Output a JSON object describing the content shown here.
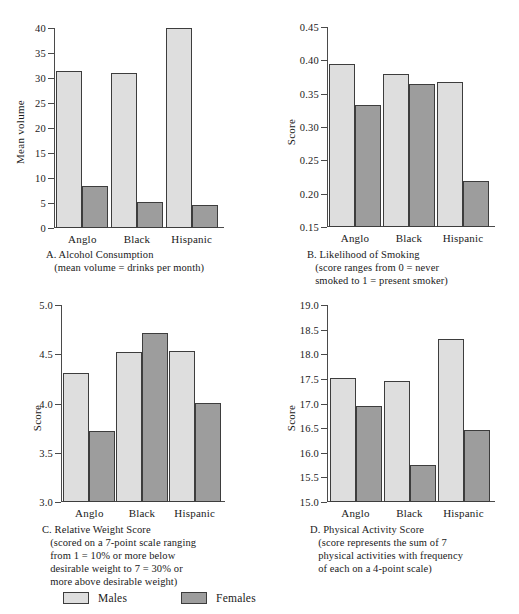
{
  "figure": {
    "categories": [
      "Anglo",
      "Black",
      "Hispanic"
    ],
    "legend": [
      {
        "key": "male",
        "label": "Males",
        "color": "#dedede"
      },
      {
        "key": "female",
        "label": "Females",
        "color": "#9d9d9d"
      }
    ]
  },
  "chart_data": [
    {
      "id": "A",
      "type": "bar",
      "title": "A. Alcohol Consumption",
      "subtitle": "(mean volume = drinks per month)",
      "caption_lines": [
        "A. Alcohol Consumption",
        "   (mean volume = drinks per month)"
      ],
      "xlabel": "",
      "ylabel": "Mean volume",
      "categories": [
        "Anglo",
        "Black",
        "Hispanic"
      ],
      "series": [
        {
          "name": "Males",
          "values": [
            31.5,
            31.0,
            40.3
          ]
        },
        {
          "name": "Females",
          "values": [
            8.5,
            5.2,
            4.6
          ]
        }
      ],
      "ylim": [
        0,
        40
      ],
      "yticks": [
        0,
        5,
        10,
        15,
        20,
        25,
        30,
        35,
        40
      ],
      "ytick_labels": [
        "0",
        "5",
        "10",
        "15",
        "20",
        "25",
        "30",
        "35",
        "40"
      ],
      "grid": false,
      "legend_position": "figure-bottom"
    },
    {
      "id": "B",
      "type": "bar",
      "title": "B. Likelihood of Smoking",
      "subtitle": "(score ranges from 0 = never smoked to 1 = present smoker)",
      "caption_lines": [
        "B. Likelihood of Smoking",
        "   (score ranges from 0 = never",
        "   smoked to 1 = present smoker)"
      ],
      "xlabel": "",
      "ylabel": "Score",
      "categories": [
        "Anglo",
        "Black",
        "Hispanic"
      ],
      "series": [
        {
          "name": "Males",
          "values": [
            0.395,
            0.379,
            0.367
          ]
        },
        {
          "name": "Females",
          "values": [
            0.333,
            0.365,
            0.219
          ]
        }
      ],
      "ylim": [
        0.15,
        0.45
      ],
      "yticks": [
        0.15,
        0.2,
        0.25,
        0.3,
        0.35,
        0.4,
        0.45
      ],
      "ytick_labels": [
        "0.15",
        "0.20",
        "0.25",
        "0.30",
        "0.35",
        "0.40",
        "0.45"
      ],
      "grid": false,
      "legend_position": "figure-bottom"
    },
    {
      "id": "C",
      "type": "bar",
      "title": "C. Relative Weight Score",
      "subtitle": "(scored on a 7-point scale ranging from 1 = 10% or more below desirable weight to 7 = 30% or more above desirable weight)",
      "caption_lines": [
        "C. Relative Weight Score",
        "   (scored on a 7-point scale ranging",
        "   from 1 = 10% or more below",
        "   desirable weight to 7 = 30% or",
        "   more above desirable weight)"
      ],
      "xlabel": "",
      "ylabel": "Score",
      "categories": [
        "Anglo",
        "Black",
        "Hispanic"
      ],
      "series": [
        {
          "name": "Males",
          "values": [
            4.31,
            4.52,
            4.53
          ]
        },
        {
          "name": "Females",
          "values": [
            3.72,
            4.72,
            4.01
          ]
        }
      ],
      "ylim": [
        3.0,
        5.0
      ],
      "yticks": [
        3.0,
        3.5,
        4.0,
        4.5,
        5.0
      ],
      "ytick_labels": [
        "3.0",
        "3.5",
        "4.0",
        "4.5",
        "5.0"
      ],
      "grid": false,
      "legend_position": "figure-bottom"
    },
    {
      "id": "D",
      "type": "bar",
      "title": "D. Physical Activity Score",
      "subtitle": "(score represents the sum of 7 physical activities with frequency of each on a 4-point scale)",
      "caption_lines": [
        "D. Physical Activity Score",
        "   (score represents the sum of 7",
        "   physical activities with frequency",
        "   of each on a 4-point scale)"
      ],
      "xlabel": "",
      "ylabel": "Score",
      "categories": [
        "Anglo",
        "Black",
        "Hispanic"
      ],
      "series": [
        {
          "name": "Males",
          "values": [
            17.51,
            17.46,
            18.32
          ]
        },
        {
          "name": "Females",
          "values": [
            16.94,
            15.76,
            16.46
          ]
        }
      ],
      "ylim": [
        15.0,
        19.0
      ],
      "yticks": [
        15.0,
        15.5,
        16.0,
        16.5,
        17.0,
        17.5,
        18.0,
        18.5,
        19.0
      ],
      "ytick_labels": [
        "15.0",
        "15.5",
        "16.0",
        "16.5",
        "17.0",
        "17.5",
        "18.0",
        "18.5",
        "19.0"
      ],
      "grid": false,
      "legend_position": "figure-bottom"
    }
  ]
}
